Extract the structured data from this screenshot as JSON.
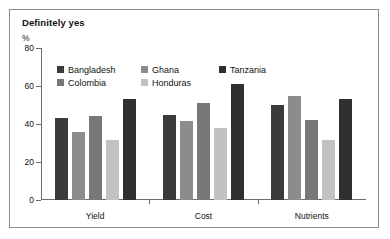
{
  "chart_data": {
    "type": "bar",
    "title": "Definitely yes",
    "subtitle": "",
    "xlabel": "",
    "ylabel": "%",
    "ylim": [
      0,
      80
    ],
    "yticks": [
      0,
      20,
      40,
      60,
      80
    ],
    "ytick_labels": [
      "0",
      "20",
      "40",
      "60",
      "80"
    ],
    "grid": false,
    "legend_position": "top-left-inside",
    "categories": [
      "Yield",
      "Cost",
      "Nutrients"
    ],
    "series": [
      {
        "name": "Bangladesh",
        "color": "#3b3b3b",
        "values": [
          43,
          45,
          50
        ]
      },
      {
        "name": "Ghana",
        "color": "#8c8c8c",
        "values": [
          36,
          41.5,
          55
        ]
      },
      {
        "name": "Colombia",
        "color": "#787878",
        "values": [
          44,
          51,
          42
        ]
      },
      {
        "name": "Honduras",
        "color": "#c2c2c2",
        "values": [
          31.5,
          38,
          31.5
        ]
      },
      {
        "name": "Tanzania",
        "color": "#303030",
        "values": [
          53,
          61,
          53
        ]
      }
    ]
  },
  "figure": {
    "border_color": "#8e8e8e",
    "background": "#ffffff",
    "axis_color": "#6d6d6d"
  }
}
